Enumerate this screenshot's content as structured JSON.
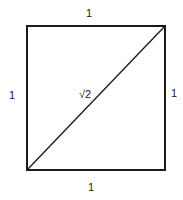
{
  "diagram": {
    "shape": "square",
    "side_labels": {
      "top": "1",
      "left": "1",
      "right": "1",
      "bottom": "1"
    },
    "diagonal_label": "√2",
    "colors": {
      "stroke": "#1a1a1a",
      "background": "#ffffff"
    }
  }
}
